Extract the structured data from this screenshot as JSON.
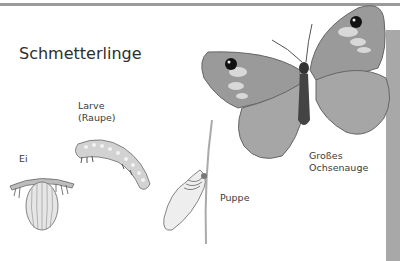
{
  "title": "Schmetterlinge",
  "stages": {
    "egg": {
      "label": "Ei"
    },
    "larva": {
      "label": "Larve\n(Raupe)"
    },
    "pupa": {
      "label": "Puppe"
    },
    "adult": {
      "label": "Großes\nOchsenauge"
    }
  },
  "colors": {
    "top_bar": "#9a9a9a",
    "side_panel": "#a8a8a8",
    "text": "#3a3a3a"
  }
}
